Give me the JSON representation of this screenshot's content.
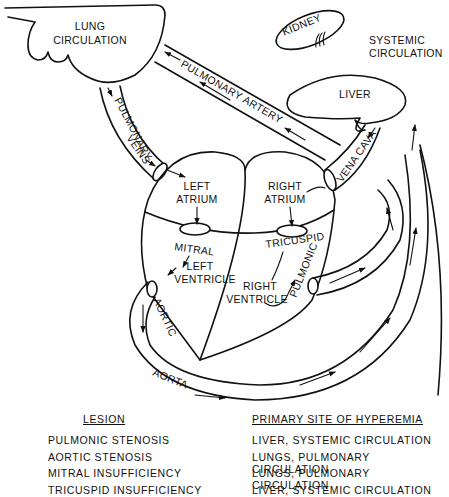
{
  "diagram": {
    "organs": {
      "lung_circulation": [
        "LUNG",
        "CIRCULATION"
      ],
      "kidney": "KIDNEY",
      "liver": "LIVER",
      "systemic_circulation": [
        "SYSTEMIC",
        "CIRCULATION"
      ]
    },
    "vessels": {
      "pulmonary_artery": "PULMONARY ARTERY",
      "pulmonary_veins": [
        "PULMONARY",
        "VEINS"
      ],
      "vena_cava": "VENA CAVA",
      "aorta": "AORTA"
    },
    "chambers": {
      "left_atrium": [
        "LEFT",
        "ATRIUM"
      ],
      "right_atrium": [
        "RIGHT",
        "ATRIUM"
      ],
      "left_ventricle": [
        "LEFT",
        "VENTRICLE"
      ],
      "right_ventricle": [
        "RIGHT",
        "VENTRICLE"
      ]
    },
    "valves": {
      "mitral": "MITRAL",
      "tricuspid": "TRICUSPID",
      "aortic": "AORTIC",
      "pulmonic": "PULMONIC"
    }
  },
  "table": {
    "headers": {
      "lesion": "LESION",
      "site": "PRIMARY SITE OF HYPEREMIA"
    },
    "rows": [
      {
        "lesion": "PULMONIC STENOSIS",
        "site": "LIVER, SYSTEMIC CIRCULATION"
      },
      {
        "lesion": "AORTIC STENOSIS",
        "site": "LUNGS, PULMONARY CIRCULATION"
      },
      {
        "lesion": "MITRAL INSUFFICIENCY",
        "site": "LUNGS, PULMONARY CIRCULATION"
      },
      {
        "lesion": "TRICUSPID INSUFFICIENCY",
        "site": "LIVER, SYSTEMIC CIRCULATION"
      }
    ]
  }
}
